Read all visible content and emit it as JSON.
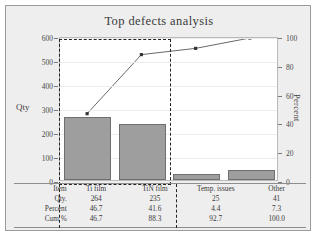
{
  "chart_data": {
    "type": "bar",
    "title": "Top defects analysis",
    "categories": [
      "Ti film",
      "TiN film",
      "Temp. issues",
      "Other"
    ],
    "values": [
      264,
      235,
      25,
      41
    ],
    "series": [
      {
        "name": "Qty",
        "values": [
          264,
          235,
          25,
          41
        ]
      },
      {
        "name": "Cum %",
        "values": [
          46.7,
          88.3,
          92.7,
          100.0
        ]
      }
    ],
    "percent": [
      46.7,
      41.6,
      4.4,
      7.3
    ],
    "cum_percent": [
      46.7,
      88.3,
      92.7,
      100.0
    ],
    "xlabel": "",
    "ylabel": "Qty",
    "y2label": "Percent",
    "ylim": [
      0,
      600
    ],
    "y2lim": [
      0,
      100
    ],
    "yticks": [
      "0",
      "100",
      "200",
      "300",
      "400",
      "500",
      "600"
    ],
    "y2ticks": [
      "0",
      "20",
      "40",
      "60",
      "80",
      "100"
    ],
    "grid": false,
    "legend": "none",
    "bar_color": "#9e9e9e",
    "line_color": "#555555",
    "selection_color": "#222222"
  },
  "chart": {
    "title": "Top defects analysis",
    "y_left_label": "Qty",
    "y_right_label": "Percent"
  },
  "axis": {
    "left_ticks": [
      "600",
      "500",
      "400",
      "300",
      "200",
      "100",
      "0"
    ],
    "right_ticks": [
      "100",
      "80",
      "60",
      "40",
      "20",
      "0"
    ]
  },
  "table": {
    "rows": [
      {
        "label": "Item",
        "cells": [
          "Ti film",
          "TiN film",
          "Temp. issues",
          "Other"
        ]
      },
      {
        "label": "Qty.",
        "cells": [
          "264",
          "235",
          "25",
          "41"
        ]
      },
      {
        "label": "Percent",
        "cells": [
          "46.7",
          "41.6",
          "4.4",
          "7.3"
        ]
      },
      {
        "label": "Cum %",
        "cells": [
          "46.7",
          "88.3",
          "92.7",
          "100.0"
        ]
      }
    ]
  }
}
